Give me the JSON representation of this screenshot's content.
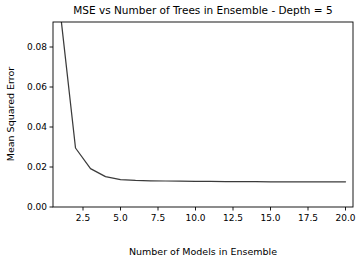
{
  "figure": {
    "background_color": "#ffffff",
    "width": 362,
    "height": 262
  },
  "chart_data": {
    "type": "line",
    "title": "MSE vs Number of Trees in Ensemble - Depth = 5",
    "xlabel": "Number of Models in Ensemble",
    "ylabel": "Mean Squared Error",
    "xlim": [
      0.5,
      20.5
    ],
    "ylim": [
      0.0,
      0.0925
    ],
    "xticks": [
      2.5,
      5.0,
      7.5,
      10.0,
      12.5,
      15.0,
      17.5,
      20.0
    ],
    "xtick_labels": [
      "2.5",
      "5.0",
      "7.5",
      "10.0",
      "12.5",
      "15.0",
      "17.5",
      "20.0"
    ],
    "yticks": [
      0.0,
      0.02,
      0.04,
      0.06,
      0.08
    ],
    "ytick_labels": [
      "0.00",
      "0.02",
      "0.04",
      "0.06",
      "0.08"
    ],
    "grid": false,
    "legend": false,
    "line_color": "#3b3b3b",
    "series": [
      {
        "name": "MSE",
        "x": [
          1,
          2,
          3,
          4,
          5,
          6,
          7,
          8,
          9,
          10,
          11,
          12,
          13,
          14,
          15,
          16,
          17,
          18,
          19,
          20
        ],
        "values": [
          0.0965,
          0.0295,
          0.0192,
          0.0152,
          0.0137,
          0.0133,
          0.0131,
          0.013,
          0.0129,
          0.0128,
          0.0128,
          0.0127,
          0.0127,
          0.0127,
          0.0126,
          0.0126,
          0.0126,
          0.0126,
          0.0126,
          0.0126
        ]
      }
    ]
  },
  "axes_geometry": {
    "left": 53,
    "right": 353,
    "top": 22,
    "bottom": 207
  }
}
